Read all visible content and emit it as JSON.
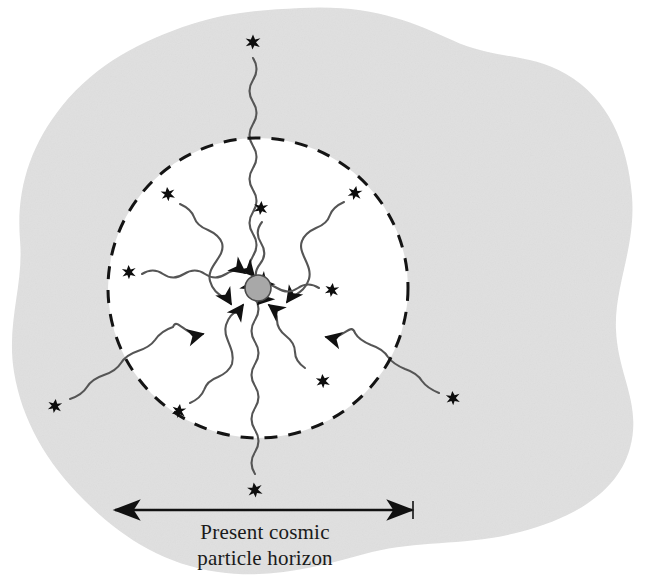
{
  "figure": {
    "caption": {
      "line1": "Present cosmic",
      "line2": "particle horizon"
    },
    "colors": {
      "background": "#ffffff",
      "universe_blob_fill": "#e0e0e0",
      "horizon_interior_fill": "#ffffff",
      "ink": "#1a1a1a",
      "observer_fill": "#a8a8a8",
      "observer_stroke": "#4a4a4a",
      "wave_stroke": "#555555"
    },
    "observer": {
      "label": "observer",
      "cx": 258,
      "cy": 288,
      "r": 13
    },
    "horizon_circle": {
      "label": "present cosmic particle horizon",
      "cx": 258,
      "cy": 288,
      "r": 150,
      "dash": "13 11",
      "stroke_width": 3
    },
    "scale_bar": {
      "label": "horizon diameter indicator",
      "x1": 115,
      "x2": 412,
      "y": 510
    },
    "stars_inside": [
      {
        "name": "star-inner-upper-left",
        "x": 168,
        "y": 194,
        "size": 15,
        "rot": -8
      },
      {
        "name": "star-inner-top",
        "x": 261,
        "y": 208,
        "size": 15,
        "rot": 4
      },
      {
        "name": "star-inner-upper-right",
        "x": 355,
        "y": 193,
        "size": 15,
        "rot": 10
      },
      {
        "name": "star-inner-left",
        "x": 129,
        "y": 272,
        "size": 15,
        "rot": -4
      },
      {
        "name": "star-inner-right",
        "x": 332,
        "y": 290,
        "size": 15,
        "rot": 6
      },
      {
        "name": "star-inner-lower-right",
        "x": 323,
        "y": 381,
        "size": 15,
        "rot": -6
      },
      {
        "name": "star-inner-lower-left",
        "x": 179,
        "y": 411,
        "size": 15,
        "rot": 8
      }
    ],
    "stars_outside": [
      {
        "name": "star-outer-top",
        "x": 253,
        "y": 42,
        "size": 16,
        "rot": 0
      },
      {
        "name": "star-outer-bottom",
        "x": 255,
        "y": 490,
        "size": 16,
        "rot": -10
      },
      {
        "name": "star-outer-left",
        "x": 55,
        "y": 406,
        "size": 15,
        "rot": 6
      },
      {
        "name": "star-outer-right",
        "x": 453,
        "y": 398,
        "size": 15,
        "rot": -6
      }
    ],
    "light_rays": [
      {
        "name": "ray-from-top-outer",
        "origin": "star-outer-top",
        "target": "observer"
      },
      {
        "name": "ray-from-bottom-outer",
        "origin": "star-outer-bottom",
        "target": "observer"
      },
      {
        "name": "ray-from-left-outer",
        "origin": "star-outer-left",
        "target": "observer"
      },
      {
        "name": "ray-from-right-outer",
        "origin": "star-outer-right",
        "target": "observer"
      },
      {
        "name": "ray-from-upper-left-star",
        "origin": "star-inner-upper-left",
        "target": "observer"
      },
      {
        "name": "ray-from-top-star",
        "origin": "star-inner-top",
        "target": "observer"
      },
      {
        "name": "ray-from-upper-right-star",
        "origin": "star-inner-upper-right",
        "target": "observer"
      },
      {
        "name": "ray-from-left-star",
        "origin": "star-inner-left",
        "target": "observer"
      },
      {
        "name": "ray-from-right-star",
        "origin": "star-inner-right",
        "target": "observer"
      },
      {
        "name": "ray-from-lower-left-star",
        "origin": "star-inner-lower-left",
        "target": "observer"
      }
    ]
  }
}
